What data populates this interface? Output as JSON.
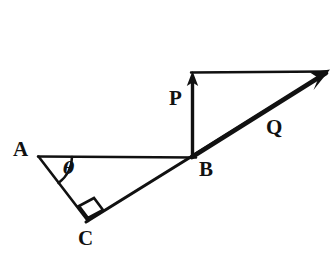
{
  "figure": {
    "background_color": "#ffffff",
    "ink_color": "#111111",
    "labels": {
      "A": "A",
      "B": "B",
      "C": "C",
      "P": "P",
      "Q": "Q",
      "theta": "θ"
    },
    "points": {
      "A": {
        "x": 38,
        "y": 156
      },
      "B": {
        "x": 193,
        "y": 157
      },
      "C": {
        "x": 88,
        "y": 219
      },
      "P_tip": {
        "x": 192,
        "y": 72
      },
      "Q_tip": {
        "x": 328,
        "y": 71
      },
      "top_left_corner": {
        "x": 192,
        "y": 72
      }
    },
    "segments": [
      {
        "name": "AB-baseline",
        "from": "A",
        "to": "B",
        "style": "thin"
      },
      {
        "name": "AC-side",
        "from": "A",
        "to": "C",
        "style": "thin"
      },
      {
        "name": "C-through-B-to-Qtip",
        "from": "C",
        "to": "Q_tip",
        "style": "thick"
      },
      {
        "name": "top-horizontal",
        "from": "top_left_corner",
        "to": "Q_tip",
        "style": "thin"
      }
    ],
    "arrows": [
      {
        "name": "P-vector",
        "from": "B",
        "to": "P_tip",
        "direction": "up",
        "label": "P"
      },
      {
        "name": "Q-vector",
        "from": "B",
        "to": "Q_tip",
        "direction": "up-right",
        "label": "Q"
      }
    ],
    "markers": [
      {
        "name": "angle-arc-at-A",
        "vertex": "A",
        "label": "θ"
      },
      {
        "name": "right-angle-square-at-C",
        "vertex": "C",
        "angle_degrees": 90
      }
    ]
  }
}
